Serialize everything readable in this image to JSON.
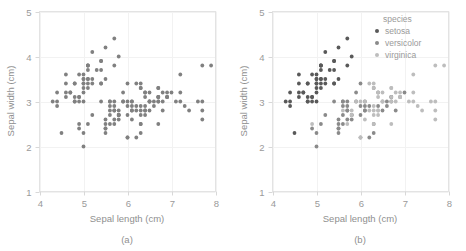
{
  "figure": {
    "background": "#ffffff",
    "panels": [
      {
        "caption": "(a)",
        "xlabel": "Sepal length (cm)",
        "ylabel": "Sepal width (cm)",
        "legend": null
      },
      {
        "caption": "(b)",
        "xlabel": "Sepal length (cm)",
        "ylabel": "Sepal width (cm)",
        "legend": {
          "title": "species",
          "entries": [
            {
              "label": "setosa",
              "color": "#595959"
            },
            {
              "label": "versicolor",
              "color": "#8a8a8a"
            },
            {
              "label": "virginica",
              "color": "#bdbdbd"
            }
          ]
        }
      }
    ]
  },
  "chart_data": [
    {
      "type": "scatter",
      "title": "(a)",
      "xlabel": "Sepal length (cm)",
      "ylabel": "Sepal width (cm)",
      "xlim": [
        4,
        8
      ],
      "ylim": [
        1,
        5
      ],
      "xticks": [
        4,
        5,
        6,
        7,
        8
      ],
      "yticks": [
        1,
        2,
        3,
        4,
        5
      ],
      "grid": true,
      "legend": "none",
      "marker_color": "#808080",
      "marker_size": 3,
      "series": [
        {
          "name": "all",
          "color": "#808080",
          "x": [
            5.1,
            4.9,
            4.7,
            4.6,
            5.0,
            5.4,
            4.6,
            5.0,
            4.4,
            4.9,
            5.4,
            4.8,
            4.8,
            4.3,
            5.8,
            5.7,
            5.4,
            5.1,
            5.7,
            5.1,
            5.4,
            5.1,
            4.6,
            5.1,
            4.8,
            5.0,
            5.0,
            5.2,
            5.2,
            4.7,
            4.8,
            5.4,
            5.2,
            5.5,
            4.9,
            5.0,
            5.5,
            4.9,
            4.4,
            5.1,
            5.0,
            4.5,
            4.4,
            5.0,
            5.1,
            4.8,
            5.1,
            4.6,
            5.3,
            5.0,
            7.0,
            6.4,
            6.9,
            5.5,
            6.5,
            5.7,
            6.3,
            4.9,
            6.6,
            5.2,
            5.0,
            5.9,
            6.0,
            6.1,
            5.6,
            6.7,
            5.6,
            5.8,
            6.2,
            5.6,
            5.9,
            6.1,
            6.3,
            6.1,
            6.4,
            6.6,
            6.8,
            6.7,
            6.0,
            5.7,
            5.5,
            5.5,
            5.8,
            6.0,
            5.4,
            6.0,
            6.7,
            6.3,
            5.6,
            5.5,
            5.5,
            6.1,
            5.8,
            5.0,
            5.6,
            5.7,
            5.7,
            6.2,
            5.1,
            5.7,
            6.3,
            5.8,
            7.1,
            6.3,
            6.5,
            7.6,
            4.9,
            7.3,
            6.7,
            7.2,
            6.5,
            6.4,
            6.8,
            5.7,
            5.8,
            6.4,
            6.5,
            7.7,
            7.7,
            6.0,
            6.9,
            5.6,
            7.7,
            6.3,
            6.7,
            7.2,
            6.2,
            6.1,
            6.4,
            7.2,
            7.4,
            7.9,
            6.4,
            6.3,
            6.1,
            7.7,
            6.3,
            6.4,
            6.0,
            6.9,
            6.7,
            6.9,
            5.8,
            6.8,
            6.7,
            6.7,
            6.3,
            6.5,
            6.2,
            5.9
          ],
          "y": [
            3.5,
            3.0,
            3.2,
            3.1,
            3.6,
            3.9,
            3.4,
            3.4,
            2.9,
            3.1,
            3.7,
            3.4,
            3.0,
            3.0,
            4.0,
            4.4,
            3.9,
            3.5,
            3.8,
            3.8,
            3.4,
            3.7,
            3.6,
            3.3,
            3.4,
            3.0,
            3.4,
            3.5,
            3.4,
            3.2,
            3.1,
            3.4,
            4.1,
            4.2,
            3.1,
            3.2,
            3.5,
            3.6,
            3.0,
            3.4,
            3.5,
            2.3,
            3.2,
            3.5,
            3.8,
            3.0,
            3.8,
            3.2,
            3.7,
            3.3,
            3.2,
            3.2,
            3.1,
            2.3,
            2.8,
            2.8,
            3.3,
            2.4,
            2.9,
            2.7,
            2.0,
            3.0,
            2.2,
            2.9,
            2.9,
            3.1,
            3.0,
            2.7,
            2.2,
            2.5,
            3.2,
            2.8,
            2.5,
            2.8,
            2.9,
            3.0,
            2.8,
            3.0,
            2.9,
            2.6,
            2.4,
            2.4,
            2.7,
            2.7,
            3.0,
            3.4,
            3.1,
            2.3,
            3.0,
            2.5,
            2.6,
            3.0,
            2.6,
            2.3,
            2.7,
            3.0,
            2.9,
            2.9,
            2.5,
            2.8,
            3.3,
            2.7,
            3.0,
            2.9,
            3.0,
            3.0,
            2.5,
            2.9,
            2.5,
            3.6,
            3.2,
            2.7,
            3.0,
            2.5,
            2.8,
            3.2,
            3.0,
            3.8,
            2.6,
            2.2,
            3.2,
            2.8,
            2.8,
            2.7,
            3.3,
            3.2,
            2.8,
            3.0,
            2.8,
            3.0,
            2.8,
            3.8,
            2.8,
            2.8,
            2.6,
            3.0,
            3.4,
            3.1,
            3.0,
            3.1,
            3.1,
            3.1,
            2.7,
            3.2,
            3.3,
            3.0,
            2.5,
            3.0,
            3.4,
            3.0
          ]
        }
      ]
    },
    {
      "type": "scatter",
      "title": "(b)",
      "xlabel": "Sepal length (cm)",
      "ylabel": "Sepal width (cm)",
      "xlim": [
        4,
        8
      ],
      "ylim": [
        1,
        5
      ],
      "xticks": [
        4,
        5,
        6,
        7,
        8
      ],
      "yticks": [
        1,
        2,
        3,
        4,
        5
      ],
      "grid": true,
      "legend": "upper right",
      "legend_title": "species",
      "marker_size": 3,
      "series": [
        {
          "name": "setosa",
          "color": "#595959",
          "x": [
            5.1,
            4.9,
            4.7,
            4.6,
            5.0,
            5.4,
            4.6,
            5.0,
            4.4,
            4.9,
            5.4,
            4.8,
            4.8,
            4.3,
            5.8,
            5.7,
            5.4,
            5.1,
            5.7,
            5.1,
            5.4,
            5.1,
            4.6,
            5.1,
            4.8,
            5.0,
            5.0,
            5.2,
            5.2,
            4.7,
            4.8,
            5.4,
            5.2,
            5.5,
            4.9,
            5.0,
            5.5,
            4.9,
            4.4,
            5.1,
            5.0,
            4.5,
            4.4,
            5.0,
            5.1,
            4.8,
            5.1,
            4.6,
            5.3,
            5.0
          ],
          "y": [
            3.5,
            3.0,
            3.2,
            3.1,
            3.6,
            3.9,
            3.4,
            3.4,
            2.9,
            3.1,
            3.7,
            3.4,
            3.0,
            3.0,
            4.0,
            4.4,
            3.9,
            3.5,
            3.8,
            3.8,
            3.4,
            3.7,
            3.6,
            3.3,
            3.4,
            3.0,
            3.4,
            3.5,
            3.4,
            3.2,
            3.1,
            3.4,
            4.1,
            4.2,
            3.1,
            3.2,
            3.5,
            3.6,
            3.0,
            3.4,
            3.5,
            2.3,
            3.2,
            3.5,
            3.8,
            3.0,
            3.8,
            3.2,
            3.7,
            3.3
          ]
        },
        {
          "name": "versicolor",
          "color": "#8a8a8a",
          "x": [
            7.0,
            6.4,
            6.9,
            5.5,
            6.5,
            5.7,
            6.3,
            4.9,
            6.6,
            5.2,
            5.0,
            5.9,
            6.0,
            6.1,
            5.6,
            6.7,
            5.6,
            5.8,
            6.2,
            5.6,
            5.9,
            6.1,
            6.3,
            6.1,
            6.4,
            6.6,
            6.8,
            6.7,
            6.0,
            5.7,
            5.5,
            5.5,
            5.8,
            6.0,
            5.4,
            6.0,
            6.7,
            6.3,
            5.6,
            5.5,
            5.5,
            6.1,
            5.8,
            5.0,
            5.6,
            5.7,
            5.7,
            6.2,
            5.1,
            5.7
          ],
          "y": [
            3.2,
            3.2,
            3.1,
            2.3,
            2.8,
            2.8,
            3.3,
            2.4,
            2.9,
            2.7,
            2.0,
            3.0,
            2.2,
            2.9,
            2.9,
            3.1,
            3.0,
            2.7,
            2.2,
            2.5,
            3.2,
            2.8,
            2.5,
            2.8,
            2.9,
            3.0,
            2.8,
            3.0,
            2.9,
            2.6,
            2.4,
            2.4,
            2.7,
            2.7,
            3.0,
            3.4,
            3.1,
            2.3,
            3.0,
            2.5,
            2.6,
            3.0,
            2.6,
            2.3,
            2.7,
            3.0,
            2.9,
            2.9,
            2.5,
            2.8
          ]
        },
        {
          "name": "virginica",
          "color": "#bdbdbd",
          "x": [
            6.3,
            5.8,
            7.1,
            6.3,
            6.5,
            7.6,
            4.9,
            7.3,
            6.7,
            7.2,
            6.5,
            6.4,
            6.8,
            5.7,
            5.8,
            6.4,
            6.5,
            7.7,
            7.7,
            6.0,
            6.9,
            5.6,
            7.7,
            6.3,
            6.7,
            7.2,
            6.2,
            6.1,
            6.4,
            7.2,
            7.4,
            7.9,
            6.4,
            6.3,
            6.1,
            7.7,
            6.3,
            6.4,
            6.0,
            6.9,
            6.7,
            6.9,
            5.8,
            6.8,
            6.7,
            6.7,
            6.3,
            6.5,
            6.2,
            5.9
          ],
          "y": [
            3.3,
            2.7,
            3.0,
            2.9,
            3.0,
            3.0,
            2.5,
            2.9,
            2.5,
            3.6,
            3.2,
            2.7,
            3.0,
            2.5,
            2.8,
            3.2,
            3.0,
            3.8,
            2.6,
            2.2,
            3.2,
            2.8,
            2.8,
            2.7,
            3.3,
            3.2,
            2.8,
            3.0,
            2.8,
            3.0,
            2.8,
            3.8,
            2.8,
            2.8,
            2.6,
            3.0,
            3.4,
            3.1,
            3.0,
            3.1,
            3.1,
            3.1,
            2.7,
            3.2,
            3.3,
            3.0,
            2.5,
            3.0,
            3.4,
            3.0
          ]
        }
      ]
    }
  ]
}
